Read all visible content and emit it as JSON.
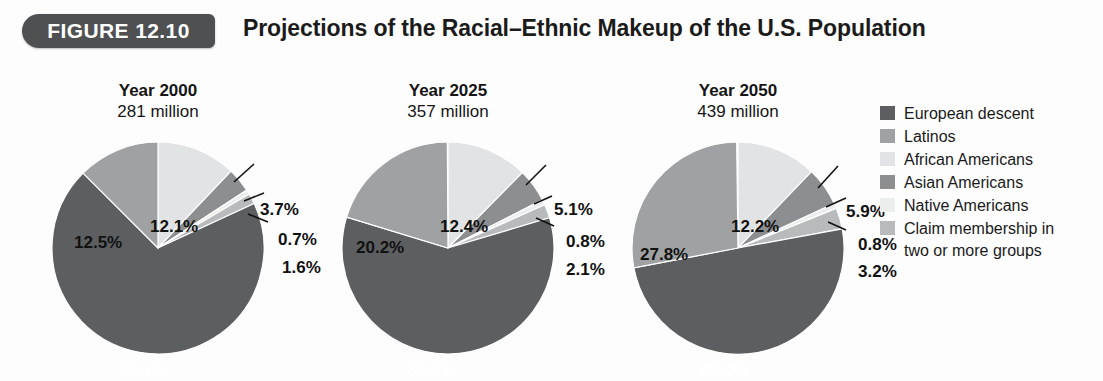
{
  "header": {
    "badge_label": "FIGURE 12.10",
    "title": "Projections of the Racial–Ethnic Makeup of the U.S. Population"
  },
  "colors": {
    "european_descent": "#5c5e60",
    "latinos": "#9fa1a3",
    "african_americans": "#e2e3e4",
    "asian_americans": "#8c8e90",
    "native_americans": "#eceded",
    "two_or_more": "#b9babc",
    "badge_background": "#4f5052",
    "page_background": "#fdfdfd",
    "label_dark": "#111111",
    "label_light": "#ffffff"
  },
  "legend": {
    "items": [
      {
        "label": "European descent",
        "label2": "",
        "color_key": "european_descent"
      },
      {
        "label": "Latinos",
        "label2": "",
        "color_key": "latinos"
      },
      {
        "label": "African Americans",
        "label2": "",
        "color_key": "african_americans"
      },
      {
        "label": "Asian Americans",
        "label2": "",
        "color_key": "asian_americans"
      },
      {
        "label": "Native Americans",
        "label2": "",
        "color_key": "native_americans"
      },
      {
        "label": "Claim membership in",
        "label2": "two or more groups",
        "color_key": "two_or_more"
      }
    ]
  },
  "chart_data": {
    "type": "pie",
    "title": "Projections of the Racial–Ethnic Makeup of the U.S. Population",
    "legend_position": "right",
    "categories": [
      "European descent",
      "Latinos",
      "African Americans",
      "Asian Americans",
      "Native Americans",
      "Claim membership in two or more groups"
    ],
    "units": "percent",
    "charts": [
      {
        "title": "Year 2000",
        "subtitle": "281 million",
        "total_population": "281 million",
        "slices": [
          {
            "category": "African Americans",
            "value": 12.1,
            "label": "12.1%"
          },
          {
            "category": "Asian Americans",
            "value": 3.7,
            "label": "3.7%"
          },
          {
            "category": "Native Americans",
            "value": 0.7,
            "label": "0.7%"
          },
          {
            "category": "Claim membership in two or more groups",
            "value": 1.6,
            "label": "1.6%"
          },
          {
            "category": "European descent",
            "value": 69.4,
            "label": "69.4%"
          },
          {
            "category": "Latinos",
            "value": 12.5,
            "label": "12.5%"
          }
        ]
      },
      {
        "title": "Year 2025",
        "subtitle": "357 million",
        "total_population": "357 million",
        "slices": [
          {
            "category": "African Americans",
            "value": 12.4,
            "label": "12.4%"
          },
          {
            "category": "Asian Americans",
            "value": 5.1,
            "label": "5.1%"
          },
          {
            "category": "Native Americans",
            "value": 0.8,
            "label": "0.8%"
          },
          {
            "category": "Claim membership in two or more groups",
            "value": 2.1,
            "label": "2.1%"
          },
          {
            "category": "European descent",
            "value": 59.3,
            "label": "59.3%"
          },
          {
            "category": "Latinos",
            "value": 20.2,
            "label": "20.2%"
          }
        ]
      },
      {
        "title": "Year 2050",
        "subtitle": "439 million",
        "total_population": "439 million",
        "slices": [
          {
            "category": "African Americans",
            "value": 12.2,
            "label": "12.2%"
          },
          {
            "category": "Asian Americans",
            "value": 5.9,
            "label": "5.9%"
          },
          {
            "category": "Native Americans",
            "value": 0.8,
            "label": "0.8%"
          },
          {
            "category": "Claim membership in two or more groups",
            "value": 3.2,
            "label": "3.2%"
          },
          {
            "category": "European descent",
            "value": 49.9,
            "label": "49.9%"
          },
          {
            "category": "Latinos",
            "value": 27.8,
            "label": "27.8%"
          }
        ]
      }
    ]
  }
}
